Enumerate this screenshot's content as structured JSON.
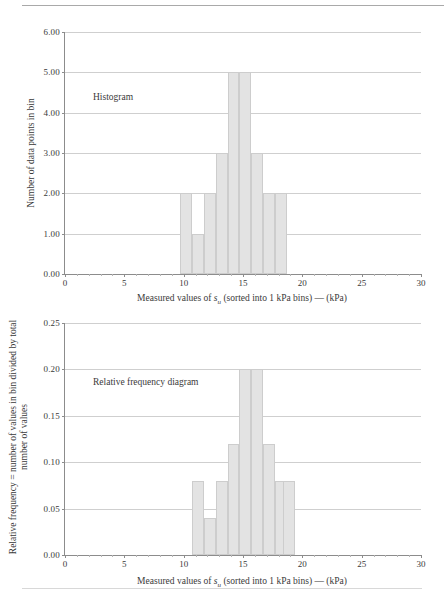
{
  "chart_data": [
    {
      "type": "bar",
      "title": "Histogram",
      "xlabel": "Measured values of s_u (sorted into 1 kPa bins) — (kPa)",
      "ylabel": "Number of data points in bin",
      "xlim": [
        0,
        30
      ],
      "ylim": [
        0,
        6
      ],
      "xticks": [
        0,
        5,
        10,
        15,
        20,
        25,
        30
      ],
      "xtick_labels": [
        "0",
        "5",
        "10",
        "15",
        "20",
        "25",
        "30"
      ],
      "yticks": [
        0,
        1,
        2,
        3,
        4,
        5,
        6
      ],
      "ytick_labels": [
        "0.00",
        "1.00",
        "2.00",
        "3.00",
        "4.00",
        "5.00",
        "6.00"
      ],
      "grid": true,
      "legend": "none",
      "bin_width": 1,
      "bin_starts": [
        9.7,
        10.7,
        11.7,
        12.7,
        13.7,
        14.7,
        15.7,
        16.7,
        17.7
      ],
      "values": [
        2,
        1,
        2,
        3,
        5,
        5,
        3,
        2,
        2
      ],
      "bar_fill": "#e3e3e3",
      "bar_stroke": "#cdcdcd"
    },
    {
      "type": "bar",
      "title": "Relative frequency diagram",
      "xlabel": "Measured values of s_u (sorted into 1 kPa bins) — (kPa)",
      "ylabel_line1": "Relative frequency = number of values in bin divided by total",
      "ylabel_line2": "number of values",
      "xlim": [
        0,
        30
      ],
      "ylim": [
        0,
        0.25
      ],
      "xticks": [
        0,
        5,
        10,
        15,
        20,
        25,
        30
      ],
      "xtick_labels": [
        "0",
        "5",
        "10",
        "15",
        "20",
        "25",
        "30"
      ],
      "yticks": [
        0,
        0.05,
        0.1,
        0.15,
        0.2,
        0.25
      ],
      "ytick_labels": [
        "0.00",
        "0.05",
        "0.10",
        "0.15",
        "0.20",
        "0.25"
      ],
      "grid": true,
      "legend": "none",
      "bin_width": 1,
      "bin_starts": [
        10.7,
        11.7,
        12.7,
        13.7,
        14.7,
        15.7,
        16.7,
        17.7,
        18.4
      ],
      "values": [
        0.08,
        0.04,
        0.08,
        0.12,
        0.2,
        0.2,
        0.12,
        0.08,
        0.08
      ],
      "bar_fill": "#e3e3e3",
      "bar_stroke": "#cdcdcd"
    }
  ],
  "figures": {
    "histogram": {
      "annotation": "Histogram",
      "xaxis_title_before": "Measured values of ",
      "xaxis_title_var": "s",
      "xaxis_title_sub": "u",
      "xaxis_title_after": " (sorted into 1 kPa bins) — (kPa)",
      "yaxis_title": "Number of data points in bin",
      "ytick_labels": [
        "0.00",
        "1.00",
        "2.00",
        "3.00",
        "4.00",
        "5.00",
        "6.00"
      ],
      "xtick_labels": [
        "0",
        "5",
        "10",
        "15",
        "20",
        "25",
        "30"
      ]
    },
    "relative_frequency": {
      "annotation": "Relative frequency diagram",
      "xaxis_title_before": "Measured values of ",
      "xaxis_title_var": "s",
      "xaxis_title_sub": "u",
      "xaxis_title_after": " (sorted into 1 kPa bins) — (kPa)",
      "yaxis_title_line1": "Relative frequency = number of values in bin divided by total",
      "yaxis_title_line2": "number of values",
      "ytick_labels": [
        "0.00",
        "0.05",
        "0.10",
        "0.15",
        "0.20",
        "0.25"
      ],
      "xtick_labels": [
        "0",
        "5",
        "10",
        "15",
        "20",
        "25",
        "30"
      ]
    }
  }
}
